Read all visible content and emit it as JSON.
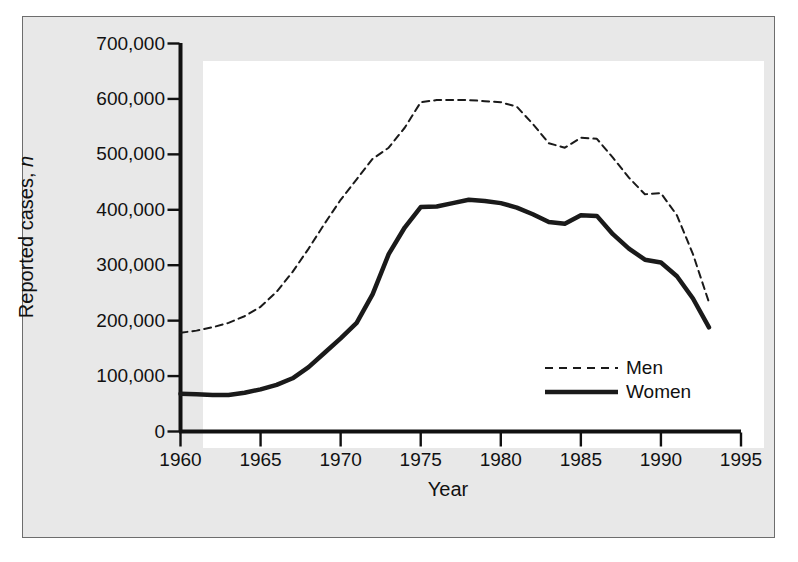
{
  "chart_data": {
    "type": "line",
    "title": "",
    "xlabel": "Year",
    "ylabel": "Reported cases, n",
    "xlim": [
      1960,
      1995
    ],
    "ylim": [
      0,
      700000
    ],
    "grid": false,
    "legend_position": "inside-lower-right",
    "x_tick_labels": [
      "1960",
      "1965",
      "1970",
      "1975",
      "1980",
      "1985",
      "1990",
      "1995"
    ],
    "x_ticks": [
      1960,
      1965,
      1970,
      1975,
      1980,
      1985,
      1990,
      1995
    ],
    "y_tick_labels": [
      "0",
      "100,000",
      "200,000",
      "300,000",
      "400,000",
      "500,000",
      "600,000",
      "700,000"
    ],
    "y_ticks": [
      0,
      100000,
      200000,
      300000,
      400000,
      500000,
      600000,
      700000
    ],
    "series": [
      {
        "name": "Men",
        "style": "dashed",
        "color": "#1a1a1a",
        "x": [
          1960,
          1961,
          1962,
          1963,
          1964,
          1965,
          1966,
          1967,
          1968,
          1969,
          1970,
          1971,
          1972,
          1973,
          1974,
          1975,
          1976,
          1977,
          1978,
          1979,
          1980,
          1981,
          1982,
          1983,
          1984,
          1985,
          1986,
          1987,
          1988,
          1989,
          1990,
          1991,
          1992,
          1993
        ],
        "values": [
          178000,
          182000,
          188000,
          196000,
          208000,
          225000,
          252000,
          288000,
          330000,
          375000,
          418000,
          455000,
          492000,
          512000,
          548000,
          594000,
          598000,
          598000,
          598000,
          596000,
          594000,
          586000,
          555000,
          520000,
          512000,
          530000,
          528000,
          494000,
          458000,
          428000,
          430000,
          390000,
          320000,
          233000
        ]
      },
      {
        "name": "Women",
        "style": "solid",
        "color": "#1a1a1a",
        "x": [
          1960,
          1961,
          1962,
          1963,
          1964,
          1965,
          1966,
          1967,
          1968,
          1969,
          1970,
          1971,
          1972,
          1973,
          1974,
          1975,
          1976,
          1977,
          1978,
          1979,
          1980,
          1981,
          1982,
          1983,
          1984,
          1985,
          1986,
          1987,
          1988,
          1989,
          1990,
          1991,
          1992,
          1993
        ],
        "values": [
          68000,
          67000,
          66000,
          66000,
          70000,
          76000,
          84000,
          96000,
          116000,
          142000,
          168000,
          196000,
          248000,
          320000,
          368000,
          405000,
          406000,
          412000,
          418000,
          416000,
          412000,
          404000,
          392000,
          378000,
          375000,
          390000,
          389000,
          356000,
          330000,
          310000,
          305000,
          280000,
          240000,
          188000
        ]
      }
    ],
    "legend": [
      {
        "label": "Men",
        "style": "dashed"
      },
      {
        "label": "Women",
        "style": "solid"
      }
    ]
  }
}
